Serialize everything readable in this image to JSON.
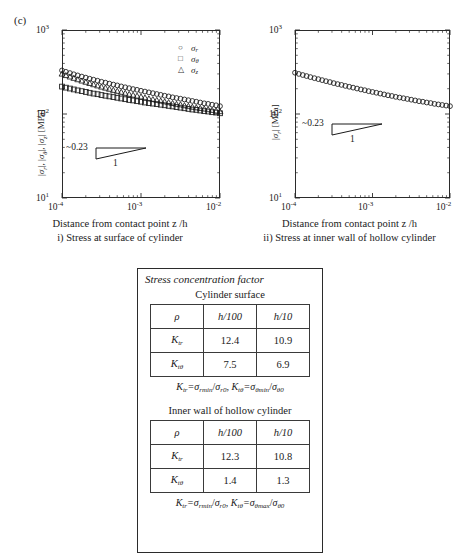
{
  "panel": {
    "label": "(c)"
  },
  "charts": [
    {
      "id": "cylinder-surface",
      "ylabel": "|σr|, |σθ|, |σz| [MPa]",
      "xlabel": "Distance from contact point z /h",
      "caption": "i) Stress at surface of cylinder",
      "slope_label": "~0.23",
      "slope_denom": "1",
      "yticks": [
        "10",
        "10",
        "10"
      ],
      "yexps": [
        "3",
        "2",
        "1"
      ],
      "xticks": [
        "10",
        "10",
        "10"
      ],
      "xexps": [
        "-4",
        "-3",
        "-2"
      ],
      "legend": [
        {
          "marker": "circle",
          "label": "σ",
          "sub": "r"
        },
        {
          "marker": "square",
          "label": "σ",
          "sub": "θ"
        },
        {
          "marker": "triangle",
          "label": "σ",
          "sub": "z"
        }
      ]
    },
    {
      "id": "inner-wall",
      "ylabel": "|σr| [MPa]",
      "xlabel": "Distance from contact point z /h",
      "caption": "ii) Stress at inner wall of hollow cylinder",
      "slope_label": "~0.23",
      "slope_denom": "1",
      "yticks": [
        "10",
        "10",
        "10"
      ],
      "yexps": [
        "3",
        "2",
        "1"
      ],
      "xticks": [
        "10",
        "10",
        "10"
      ],
      "xexps": [
        "-4",
        "-3",
        "-2"
      ],
      "legend": []
    }
  ],
  "chart_data": [
    {
      "type": "scatter",
      "title": "i) Stress at surface of cylinder",
      "xlabel": "Distance from contact point z /h",
      "ylabel": "|σr|, |σθ|, |σz| [MPa]",
      "xscale": "log",
      "yscale": "log",
      "xlim": [
        0.0001,
        0.01
      ],
      "ylim": [
        10,
        1000
      ],
      "grid": false,
      "legend_position": "top-right",
      "annotation": "~0.23 / 1 slope triangle",
      "series": [
        {
          "name": "σr",
          "marker": "circle",
          "x": [
            0.0001,
            0.000112,
            0.000126,
            0.000141,
            0.000158,
            0.000178,
            0.0002,
            0.000224,
            0.000251,
            0.000282,
            0.000316,
            0.000355,
            0.000398,
            0.000447,
            0.000501,
            0.000562,
            0.000631,
            0.000708,
            0.000794,
            0.000891,
            0.001,
            0.001122,
            0.001259,
            0.001413,
            0.001585,
            0.001778,
            0.001995,
            0.002239,
            0.002512,
            0.002818,
            0.003162,
            0.003548,
            0.003981,
            0.004467,
            0.005012,
            0.005623,
            0.00631,
            0.007079,
            0.007943,
            0.008913,
            0.01
          ],
          "y": [
            330,
            318,
            307,
            297,
            288,
            279,
            271,
            263,
            256,
            249,
            242,
            236,
            230,
            224,
            219,
            213,
            208,
            203,
            198,
            194,
            189,
            185,
            181,
            177,
            173,
            169,
            165,
            162,
            158,
            155,
            152,
            149,
            146,
            143,
            140,
            137,
            134,
            132,
            129,
            127,
            124
          ]
        },
        {
          "name": "σθ",
          "marker": "square",
          "x": [
            0.0001,
            0.000112,
            0.000126,
            0.000141,
            0.000158,
            0.000178,
            0.0002,
            0.000224,
            0.000251,
            0.000282,
            0.000316,
            0.000355,
            0.000398,
            0.000447,
            0.000501,
            0.000562,
            0.000631,
            0.000708,
            0.000794,
            0.000891,
            0.001,
            0.001122,
            0.001259,
            0.001413,
            0.001585,
            0.001778,
            0.001995,
            0.002239,
            0.002512,
            0.002818,
            0.003162,
            0.003548,
            0.003981,
            0.004467,
            0.005012,
            0.005623,
            0.00631,
            0.007079,
            0.007943,
            0.008913,
            0.01
          ],
          "y": [
            212,
            206,
            201,
            196,
            191,
            187,
            183,
            179,
            175,
            172,
            168,
            165,
            162,
            159,
            156,
            153,
            150,
            147,
            145,
            142,
            140,
            137,
            135,
            133,
            131,
            129,
            127,
            125,
            123,
            121,
            119,
            117,
            115,
            113,
            112,
            110,
            108,
            107,
            105,
            104,
            102
          ]
        },
        {
          "name": "σz",
          "marker": "triangle",
          "x": [
            0.0001,
            0.000112,
            0.000126,
            0.000141,
            0.000158,
            0.000178,
            0.0002,
            0.000224,
            0.000251,
            0.000282,
            0.000316,
            0.000355,
            0.000398,
            0.000447,
            0.000501,
            0.000562,
            0.000631,
            0.000708,
            0.000794,
            0.000891,
            0.001,
            0.001122,
            0.001259,
            0.001413,
            0.001585,
            0.001778,
            0.001995,
            0.002239,
            0.002512,
            0.002818,
            0.003162,
            0.003548,
            0.003981,
            0.004467,
            0.005012,
            0.005623,
            0.00631,
            0.007079,
            0.007943,
            0.008913,
            0.01
          ],
          "y": [
            300,
            288,
            277,
            267,
            257,
            248,
            240,
            232,
            224,
            217,
            210,
            204,
            198,
            192,
            187,
            182,
            177,
            172,
            168,
            164,
            160,
            156,
            152,
            149,
            146,
            143,
            140,
            137,
            134,
            131,
            129,
            126,
            124,
            121,
            119,
            117,
            115,
            113,
            111,
            109,
            107
          ]
        }
      ]
    },
    {
      "type": "scatter",
      "title": "ii) Stress at inner wall of hollow cylinder",
      "xlabel": "Distance from contact point z /h",
      "ylabel": "|σr| [MPa]",
      "xscale": "log",
      "yscale": "log",
      "xlim": [
        0.0001,
        0.01
      ],
      "ylim": [
        10,
        1000
      ],
      "grid": false,
      "legend_position": "none",
      "annotation": "~0.23 / 1 slope triangle",
      "series": [
        {
          "name": "σr",
          "marker": "circle",
          "x": [
            0.0001,
            0.000112,
            0.000126,
            0.000141,
            0.000158,
            0.000178,
            0.0002,
            0.000224,
            0.000251,
            0.000282,
            0.000316,
            0.000355,
            0.000398,
            0.000447,
            0.000501,
            0.000562,
            0.000631,
            0.000708,
            0.000794,
            0.000891,
            0.001,
            0.001122,
            0.001259,
            0.001413,
            0.001585,
            0.001778,
            0.001995,
            0.002239,
            0.002512,
            0.002818,
            0.003162,
            0.003548,
            0.003981,
            0.004467,
            0.005012,
            0.005623,
            0.00631,
            0.007079,
            0.007943,
            0.008913,
            0.01
          ],
          "y": [
            310,
            300,
            291,
            283,
            275,
            267,
            260,
            253,
            246,
            240,
            233,
            227,
            222,
            216,
            211,
            206,
            201,
            196,
            192,
            187,
            183,
            179,
            175,
            171,
            167,
            164,
            160,
            157,
            154,
            151,
            148,
            145,
            142,
            140,
            137,
            135,
            132,
            130,
            128,
            126,
            124
          ]
        }
      ]
    }
  ],
  "card": {
    "title": "Stress concentration factor",
    "sections": [
      {
        "heading": "Cylinder surface",
        "headers": [
          "ρ",
          "h/100",
          "h/10"
        ],
        "rows": [
          {
            "label": "K",
            "sub": "tr",
            "values": [
              "12.4",
              "10.9"
            ]
          },
          {
            "label": "K",
            "sub": "tθ",
            "values": [
              "7.5",
              "6.9"
            ]
          }
        ],
        "formula_parts": {
          "k1": "K",
          "k1sub": "tr",
          "n1": "σ",
          "n1sub": "rmin",
          "d1": "σ",
          "d1sub": "r0",
          "k2": "K",
          "k2sub": "tθ",
          "n2": "σ",
          "n2sub": "θmin",
          "d2": "σ",
          "d2sub": "θ0"
        }
      },
      {
        "heading": "Inner wall of hollow cylinder",
        "headers": [
          "ρ",
          "h/100",
          "h/10"
        ],
        "rows": [
          {
            "label": "K",
            "sub": "tr",
            "values": [
              "12.3",
              "10.8"
            ]
          },
          {
            "label": "K",
            "sub": "tθ",
            "values": [
              "1.4",
              "1.3"
            ]
          }
        ],
        "formula_parts": {
          "k1": "K",
          "k1sub": "tr",
          "n1": "σ",
          "n1sub": "rmin",
          "d1": "σ",
          "d1sub": "r0",
          "k2": "K",
          "k2sub": "tθ",
          "n2": "σ",
          "n2sub": "θmax",
          "d2": "σ",
          "d2sub": "θ0"
        }
      }
    ]
  }
}
